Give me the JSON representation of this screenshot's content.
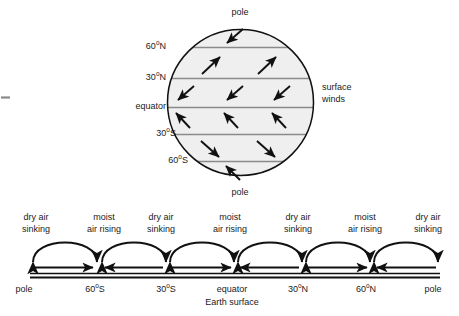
{
  "diagram": {
    "title_hidden": "",
    "globe": {
      "pole_top_label": "pole",
      "pole_bottom_label": "pole",
      "side_label": "surface\nwinds",
      "latitude_labels": [
        {
          "id": "lat-60n",
          "text": "60",
          "deg": "o",
          "hemi": "N",
          "y": 47
        },
        {
          "id": "lat-30n",
          "text": "30",
          "deg": "o",
          "hemi": "N",
          "y": 78
        },
        {
          "id": "lat-eq",
          "text": "equator",
          "deg": "",
          "hemi": "",
          "y": 107
        },
        {
          "id": "lat-30s",
          "text": "30",
          "deg": "o",
          "hemi": "S",
          "y": 134
        },
        {
          "id": "lat-60s",
          "text": "60",
          "deg": "o",
          "hemi": "S",
          "y": 161
        }
      ],
      "bands": [
        {
          "name": "north-polar-cell",
          "wind": "southwest",
          "arrows": 1
        },
        {
          "name": "north-ferrel-cell",
          "wind": "northeast",
          "arrows": 2
        },
        {
          "name": "north-hadley-cell",
          "wind": "southwest",
          "arrows": 3
        },
        {
          "name": "south-hadley-cell",
          "wind": "northwest",
          "arrows": 3
        },
        {
          "name": "south-ferrel-cell",
          "wind": "southeast",
          "arrows": 2
        },
        {
          "name": "south-polar-cell",
          "wind": "northwest",
          "arrows": 1
        }
      ]
    },
    "cross_section": {
      "surface_label": "Earth surface",
      "air_labels": [
        {
          "id": "air-0",
          "text": "dry air\nsinking",
          "x": 36
        },
        {
          "id": "air-1",
          "text": "moist\nair rising",
          "x": 104
        },
        {
          "id": "air-2",
          "text": "dry air\nsinking",
          "x": 161
        },
        {
          "id": "air-3",
          "text": "moist\nair rising",
          "x": 230
        },
        {
          "id": "air-4",
          "text": "dry air\nsinking",
          "x": 298
        },
        {
          "id": "air-5",
          "text": "moist\nair rising",
          "x": 365
        },
        {
          "id": "air-6",
          "text": "dry air\nsinking",
          "x": 428
        }
      ],
      "axis_labels": [
        {
          "id": "x-pole-s",
          "text": "pole",
          "deg": "",
          "hemi": "",
          "x": 24
        },
        {
          "id": "x-60s",
          "text": "60",
          "deg": "o",
          "hemi": "S",
          "x": 95
        },
        {
          "id": "x-30s",
          "text": "30",
          "deg": "o",
          "hemi": "S",
          "x": 166
        },
        {
          "id": "x-equator",
          "text": "equator",
          "deg": "",
          "hemi": "",
          "x": 232
        },
        {
          "id": "x-30n",
          "text": "30",
          "deg": "o",
          "hemi": "N",
          "x": 298
        },
        {
          "id": "x-60n",
          "text": "60",
          "deg": "o",
          "hemi": "N",
          "x": 366
        },
        {
          "id": "x-pole-n",
          "text": "pole",
          "deg": "",
          "hemi": "",
          "x": 433
        }
      ],
      "surface_flows": [
        {
          "name": "flow-polar-s",
          "direction": "right"
        },
        {
          "name": "flow-ferrel-s",
          "direction": "left"
        },
        {
          "name": "flow-hadley-s",
          "direction": "right"
        },
        {
          "name": "flow-hadley-n",
          "direction": "left"
        },
        {
          "name": "flow-ferrel-n",
          "direction": "right"
        },
        {
          "name": "flow-polar-n",
          "direction": "left"
        }
      ]
    },
    "colors": {
      "band_fill": "#efefef",
      "band_line": "#888888",
      "outline": "#111111",
      "text": "#1a1a1a"
    }
  }
}
